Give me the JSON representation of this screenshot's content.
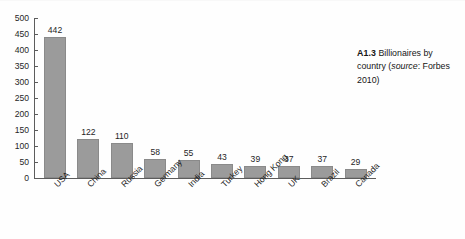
{
  "chart_data": {
    "type": "bar",
    "title": "",
    "xlabel": "",
    "ylabel": "",
    "ylim": [
      0,
      500
    ],
    "ytick_step": 50,
    "grid": false,
    "legend": null,
    "bar_color": "#9b9b9b",
    "categories": [
      "USA",
      "China",
      "Russia",
      "Germany",
      "India",
      "Turkey",
      "Hong Kong",
      "UK",
      "Brazil",
      "Canada"
    ],
    "values": [
      442,
      122,
      110,
      58,
      55,
      43,
      39,
      37,
      37,
      29
    ],
    "yticks": [
      "0",
      "50",
      "100",
      "150",
      "200",
      "250",
      "300",
      "350",
      "400",
      "450",
      "500"
    ],
    "data_labels": [
      "442",
      "122",
      "110",
      "58",
      "55",
      "43",
      "39",
      "37",
      "37",
      "29"
    ]
  },
  "caption": {
    "ref": "A1.3",
    "text_before_source": " Billionaires by country (",
    "source_word": "source",
    "text_after_source": ": Forbes 2010)"
  }
}
